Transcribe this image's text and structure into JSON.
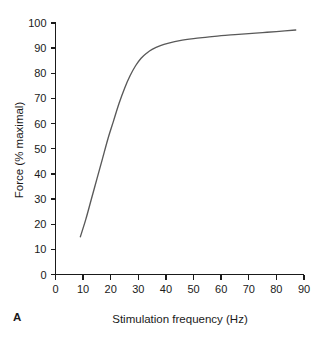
{
  "panel": {
    "label": "A"
  },
  "chart_data": {
    "type": "line",
    "title": "",
    "subtitle": "",
    "xlabel": "Stimulation frequency (Hz)",
    "ylabel": "Force (% maximal)",
    "xlim": [
      0,
      90
    ],
    "ylim": [
      0,
      100
    ],
    "xticks": [
      0,
      10,
      20,
      30,
      40,
      50,
      60,
      70,
      80,
      90
    ],
    "yticks": [
      0,
      10,
      20,
      30,
      40,
      50,
      60,
      70,
      80,
      90,
      100
    ],
    "xtick_labels": [
      "0",
      "10",
      "20",
      "30",
      "40",
      "50",
      "60",
      "70",
      "80",
      "90"
    ],
    "ytick_labels": [
      "0",
      "10",
      "20",
      "30",
      "40",
      "50",
      "60",
      "70",
      "80",
      "90",
      "100"
    ],
    "grid": false,
    "legend": false,
    "legend_position": "none",
    "annotations": [],
    "series": [
      {
        "name": "Force-frequency relationship",
        "color": "#595959",
        "x": [
          9,
          11,
          13,
          15,
          17,
          19,
          21,
          23,
          25,
          27,
          29,
          31,
          33,
          35,
          38,
          41,
          45,
          50,
          55,
          60,
          65,
          70,
          75,
          80,
          87
        ],
        "y": [
          15,
          22,
          30,
          38,
          46,
          54,
          61,
          68,
          74,
          79,
          83,
          86,
          88,
          89.5,
          91,
          92,
          93,
          93.8,
          94.4,
          95,
          95.4,
          95.8,
          96.2,
          96.6,
          97.2
        ]
      }
    ]
  }
}
